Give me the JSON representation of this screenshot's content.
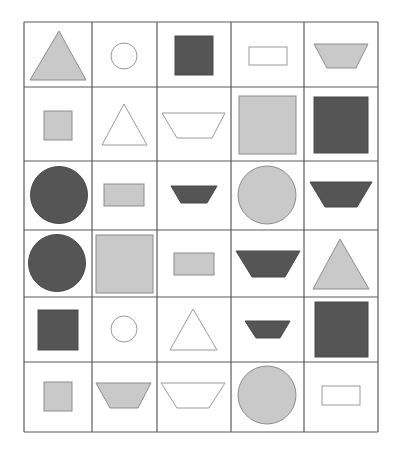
{
  "colors": {
    "background": "#ffffff",
    "grid_line": "#5a5a5a",
    "dark_fill": "#555555",
    "dark_stroke": "#4a4a4a",
    "light_fill": "#c9c9c9",
    "light_stroke": "#8c8c8c",
    "outline_fill": "#ffffff",
    "outline_stroke": "#9a9a9a"
  },
  "grid": {
    "rows": 6,
    "cols": 5,
    "x_lines": [
      24,
      92,
      157,
      231,
      304,
      378
    ],
    "y_lines": [
      22,
      87,
      161,
      230,
      297,
      362,
      432
    ]
  },
  "cells": [
    {
      "row": 0,
      "col": 0,
      "shape": "triangle",
      "fill": "light",
      "points": [
        [
          59,
          31
        ],
        [
          30,
          80
        ],
        [
          86,
          80
        ]
      ]
    },
    {
      "row": 0,
      "col": 1,
      "shape": "circle",
      "fill": "outline",
      "cx": 124,
      "cy": 56,
      "r": 13
    },
    {
      "row": 0,
      "col": 2,
      "shape": "square",
      "fill": "dark",
      "x": 175,
      "y": 36,
      "w": 38,
      "h": 39
    },
    {
      "row": 0,
      "col": 3,
      "shape": "rectangle",
      "fill": "outline",
      "x": 249,
      "y": 47,
      "w": 38,
      "h": 18
    },
    {
      "row": 0,
      "col": 4,
      "shape": "trapezoid",
      "fill": "light",
      "points": [
        [
          314,
          44
        ],
        [
          368,
          44
        ],
        [
          356,
          68
        ],
        [
          327,
          68
        ]
      ]
    },
    {
      "row": 1,
      "col": 0,
      "shape": "square",
      "fill": "light",
      "x": 44,
      "y": 111,
      "w": 28,
      "h": 29
    },
    {
      "row": 1,
      "col": 1,
      "shape": "triangle",
      "fill": "outline",
      "points": [
        [
          124,
          104
        ],
        [
          102,
          145
        ],
        [
          147,
          145
        ]
      ]
    },
    {
      "row": 1,
      "col": 2,
      "shape": "trapezoid",
      "fill": "outline",
      "points": [
        [
          162,
          113
        ],
        [
          225,
          113
        ],
        [
          212,
          138
        ],
        [
          177,
          138
        ]
      ]
    },
    {
      "row": 1,
      "col": 3,
      "shape": "square",
      "fill": "light",
      "x": 239,
      "y": 96,
      "w": 57,
      "h": 58
    },
    {
      "row": 1,
      "col": 4,
      "shape": "square",
      "fill": "dark",
      "x": 314,
      "y": 97,
      "w": 54,
      "h": 56
    },
    {
      "row": 2,
      "col": 0,
      "shape": "circle",
      "fill": "dark",
      "cx": 59,
      "cy": 195,
      "r": 28.5
    },
    {
      "row": 2,
      "col": 1,
      "shape": "rectangle",
      "fill": "light",
      "x": 104,
      "y": 184,
      "w": 40,
      "h": 22
    },
    {
      "row": 2,
      "col": 2,
      "shape": "trapezoid",
      "fill": "dark",
      "points": [
        [
          171,
          186
        ],
        [
          217,
          186
        ],
        [
          207,
          203
        ],
        [
          181,
          203
        ]
      ]
    },
    {
      "row": 2,
      "col": 3,
      "shape": "circle",
      "fill": "light",
      "cx": 267,
      "cy": 195,
      "r": 29
    },
    {
      "row": 2,
      "col": 4,
      "shape": "trapezoid",
      "fill": "dark",
      "points": [
        [
          310,
          182
        ],
        [
          372,
          182
        ],
        [
          357,
          207
        ],
        [
          325,
          207
        ]
      ]
    },
    {
      "row": 3,
      "col": 0,
      "shape": "circle",
      "fill": "dark",
      "cx": 57,
      "cy": 263,
      "r": 28.5
    },
    {
      "row": 3,
      "col": 1,
      "shape": "square",
      "fill": "light",
      "x": 96,
      "y": 235,
      "w": 57,
      "h": 58
    },
    {
      "row": 3,
      "col": 2,
      "shape": "rectangle",
      "fill": "light",
      "x": 174,
      "y": 253,
      "w": 40,
      "h": 22
    },
    {
      "row": 3,
      "col": 3,
      "shape": "trapezoid",
      "fill": "dark",
      "points": [
        [
          236,
          251
        ],
        [
          300,
          251
        ],
        [
          285,
          277
        ],
        [
          252,
          277
        ]
      ]
    },
    {
      "row": 3,
      "col": 4,
      "shape": "triangle",
      "fill": "light",
      "points": [
        [
          340,
          239
        ],
        [
          313,
          289
        ],
        [
          369,
          289
        ]
      ]
    },
    {
      "row": 4,
      "col": 0,
      "shape": "square",
      "fill": "dark",
      "x": 38,
      "y": 310,
      "w": 40,
      "h": 40
    },
    {
      "row": 4,
      "col": 1,
      "shape": "circle",
      "fill": "outline",
      "cx": 124,
      "cy": 329,
      "r": 13
    },
    {
      "row": 4,
      "col": 2,
      "shape": "triangle",
      "fill": "outline",
      "points": [
        [
          193,
          309
        ],
        [
          170,
          350
        ],
        [
          217,
          350
        ]
      ]
    },
    {
      "row": 4,
      "col": 3,
      "shape": "trapezoid",
      "fill": "dark",
      "points": [
        [
          245,
          321
        ],
        [
          290,
          321
        ],
        [
          280,
          338
        ],
        [
          256,
          338
        ]
      ]
    },
    {
      "row": 4,
      "col": 4,
      "shape": "square",
      "fill": "dark",
      "x": 315,
      "y": 302,
      "w": 53,
      "h": 55
    },
    {
      "row": 5,
      "col": 0,
      "shape": "square",
      "fill": "light",
      "x": 44,
      "y": 382,
      "w": 28,
      "h": 29
    },
    {
      "row": 5,
      "col": 1,
      "shape": "trapezoid",
      "fill": "light",
      "points": [
        [
          96,
          383
        ],
        [
          151,
          383
        ],
        [
          138,
          408
        ],
        [
          110,
          408
        ]
      ]
    },
    {
      "row": 5,
      "col": 2,
      "shape": "trapezoid",
      "fill": "outline",
      "points": [
        [
          161,
          383
        ],
        [
          225,
          383
        ],
        [
          209,
          408
        ],
        [
          177,
          408
        ]
      ]
    },
    {
      "row": 5,
      "col": 3,
      "shape": "circle",
      "fill": "light",
      "cx": 267,
      "cy": 395,
      "r": 29
    },
    {
      "row": 5,
      "col": 4,
      "shape": "rectangle",
      "fill": "outline",
      "x": 322,
      "y": 386,
      "w": 38,
      "h": 19
    }
  ]
}
